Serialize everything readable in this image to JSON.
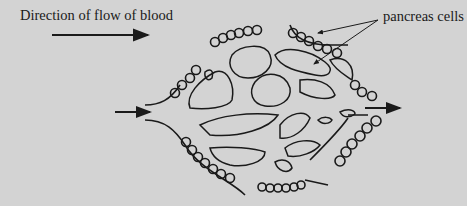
{
  "labels": {
    "direction": "Direction of flow of blood",
    "cells": "pancreas cells"
  },
  "colors": {
    "background": "#d3d3d3",
    "ink": "#1a1a1a"
  },
  "diagram": {
    "arrows": [
      "direction-of-flow-arrow",
      "inflow-arrow",
      "outflow-arrow",
      "pancreas-cells-pointers"
    ]
  }
}
